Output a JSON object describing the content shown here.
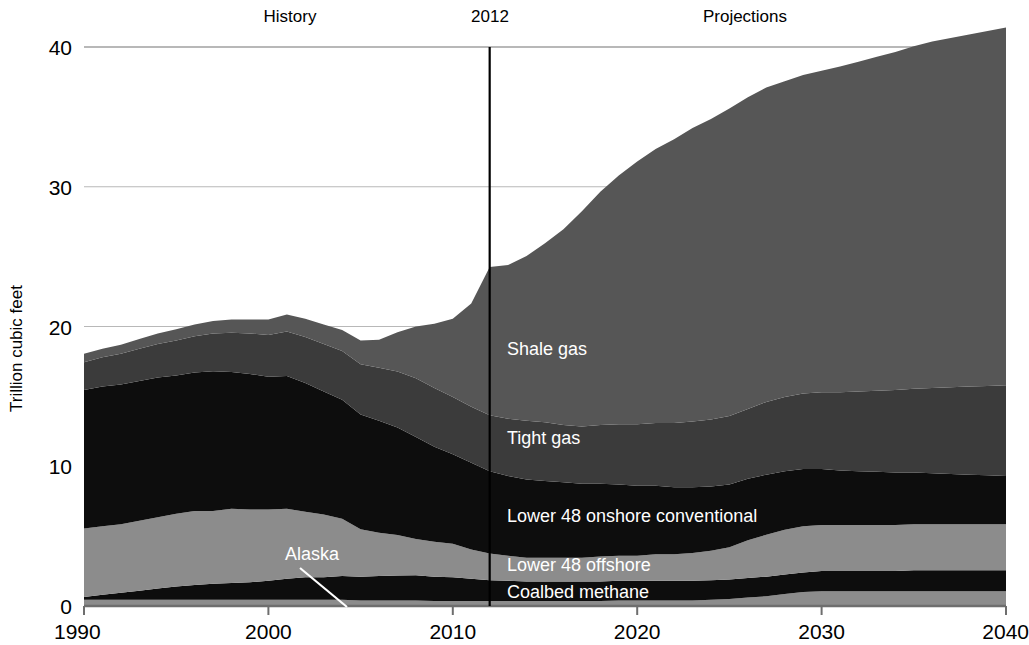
{
  "chart_data": {
    "type": "area",
    "stacked": true,
    "title": "",
    "xlabel": "",
    "ylabel": "Trillion cubic feet",
    "xlim": [
      1990,
      2040
    ],
    "ylim": [
      0,
      40
    ],
    "xticks": [
      "1990",
      "2000",
      "2010",
      "2020",
      "2030",
      "2040"
    ],
    "yticks": [
      "0",
      "10",
      "20",
      "30",
      "40"
    ],
    "grid": "horizontal",
    "legend_position": "inline-labels",
    "annotations": {
      "history": "History",
      "divider_year": "2012",
      "projections": "Projections"
    },
    "divider_x": 2012,
    "x": [
      1990,
      1991,
      1992,
      1993,
      1994,
      1995,
      1996,
      1997,
      1998,
      1999,
      2000,
      2001,
      2002,
      2003,
      2004,
      2005,
      2006,
      2007,
      2008,
      2009,
      2010,
      2011,
      2012,
      2013,
      2014,
      2015,
      2016,
      2017,
      2018,
      2019,
      2020,
      2021,
      2022,
      2023,
      2024,
      2025,
      2026,
      2027,
      2028,
      2029,
      2030,
      2031,
      2032,
      2033,
      2034,
      2035,
      2036,
      2037,
      2038,
      2039,
      2040
    ],
    "series": [
      {
        "name": "Alaska",
        "color": "#8c8c8c",
        "label_position": "callout",
        "values": [
          0.45,
          0.45,
          0.45,
          0.45,
          0.45,
          0.45,
          0.45,
          0.45,
          0.45,
          0.45,
          0.45,
          0.45,
          0.45,
          0.45,
          0.45,
          0.4,
          0.4,
          0.4,
          0.4,
          0.35,
          0.35,
          0.35,
          0.35,
          0.35,
          0.35,
          0.35,
          0.35,
          0.35,
          0.35,
          0.4,
          0.4,
          0.4,
          0.4,
          0.4,
          0.45,
          0.5,
          0.6,
          0.7,
          0.85,
          1.0,
          1.05,
          1.05,
          1.05,
          1.05,
          1.05,
          1.05,
          1.05,
          1.05,
          1.05,
          1.05,
          1.05
        ]
      },
      {
        "name": "Coalbed methane",
        "color": "#0d0d0d",
        "label_position": "inline",
        "values": [
          0.2,
          0.35,
          0.5,
          0.65,
          0.8,
          0.95,
          1.05,
          1.15,
          1.2,
          1.25,
          1.35,
          1.5,
          1.6,
          1.6,
          1.7,
          1.7,
          1.75,
          1.78,
          1.8,
          1.75,
          1.7,
          1.6,
          1.5,
          1.45,
          1.4,
          1.4,
          1.4,
          1.4,
          1.4,
          1.4,
          1.4,
          1.4,
          1.4,
          1.4,
          1.4,
          1.4,
          1.4,
          1.4,
          1.4,
          1.4,
          1.45,
          1.45,
          1.45,
          1.45,
          1.45,
          1.5,
          1.5,
          1.5,
          1.5,
          1.5,
          1.5
        ]
      },
      {
        "name": "Lower 48 offshore",
        "color": "#8c8c8c",
        "label_position": "inline",
        "values": [
          4.9,
          4.9,
          4.9,
          5.0,
          5.1,
          5.2,
          5.3,
          5.2,
          5.3,
          5.2,
          5.1,
          5.0,
          4.7,
          4.5,
          4.1,
          3.4,
          3.1,
          2.9,
          2.6,
          2.5,
          2.4,
          2.1,
          1.9,
          1.8,
          1.7,
          1.7,
          1.7,
          1.7,
          1.8,
          1.8,
          1.8,
          1.9,
          1.9,
          2.0,
          2.1,
          2.3,
          2.7,
          3.0,
          3.2,
          3.3,
          3.3,
          3.3,
          3.3,
          3.3,
          3.3,
          3.3,
          3.3,
          3.3,
          3.3,
          3.3,
          3.3
        ]
      },
      {
        "name": "Lower 48 onshore conventional",
        "color": "#0d0d0d",
        "label_position": "inline",
        "values": [
          9.9,
          10.0,
          10.0,
          10.0,
          10.0,
          9.9,
          9.9,
          10.0,
          9.8,
          9.7,
          9.5,
          9.5,
          9.2,
          8.8,
          8.5,
          8.2,
          8.0,
          7.7,
          7.3,
          6.8,
          6.4,
          6.2,
          5.9,
          5.7,
          5.6,
          5.5,
          5.4,
          5.3,
          5.2,
          5.1,
          5.0,
          4.9,
          4.8,
          4.7,
          4.6,
          4.5,
          4.4,
          4.3,
          4.2,
          4.1,
          4.0,
          3.9,
          3.85,
          3.8,
          3.75,
          3.7,
          3.65,
          3.6,
          3.55,
          3.5,
          3.45
        ]
      },
      {
        "name": "Tight gas",
        "color": "#3b3b3b",
        "label_position": "inline",
        "values": [
          2.0,
          2.1,
          2.2,
          2.3,
          2.4,
          2.5,
          2.6,
          2.7,
          2.8,
          2.9,
          3.0,
          3.2,
          3.3,
          3.4,
          3.5,
          3.6,
          3.8,
          4.0,
          4.2,
          4.2,
          4.1,
          4.0,
          4.0,
          4.1,
          4.2,
          4.2,
          4.1,
          4.1,
          4.2,
          4.3,
          4.4,
          4.5,
          4.6,
          4.7,
          4.8,
          4.9,
          5.0,
          5.2,
          5.3,
          5.4,
          5.5,
          5.6,
          5.7,
          5.8,
          5.9,
          6.0,
          6.1,
          6.2,
          6.3,
          6.4,
          6.5
        ]
      },
      {
        "name": "Shale gas",
        "color": "#565656",
        "label_position": "inline",
        "values": [
          0.6,
          0.6,
          0.65,
          0.7,
          0.75,
          0.8,
          0.85,
          0.9,
          0.95,
          1.0,
          1.1,
          1.2,
          1.3,
          1.4,
          1.5,
          1.7,
          2.0,
          2.8,
          3.7,
          4.6,
          5.6,
          7.4,
          10.6,
          11.0,
          11.8,
          12.8,
          14.0,
          15.4,
          16.7,
          17.8,
          18.8,
          19.6,
          20.3,
          21.0,
          21.5,
          22.0,
          22.3,
          22.5,
          22.6,
          22.8,
          23.0,
          23.3,
          23.6,
          23.9,
          24.2,
          24.5,
          24.8,
          25.0,
          25.2,
          25.4,
          25.6
        ]
      }
    ],
    "totals_note": [
      18.0,
      18.4,
      18.7,
      19.1,
      19.5,
      19.75,
      20.15,
      19.95,
      20.3,
      20.4,
      20.5,
      20.85,
      20.55,
      20.15,
      19.8,
      19.0,
      19.05,
      19.58,
      19.97,
      20.1,
      20.45,
      21.65,
      24.25,
      24.4,
      25.05,
      25.95,
      26.95,
      28.25,
      29.65,
      30.8,
      31.85,
      32.7,
      33.4,
      34.2,
      34.85,
      35.6,
      36.05,
      36.4,
      36.55,
      36.8,
      37.25,
      37.5,
      37.75,
      38.0,
      38.25,
      38.5,
      38.75,
      38.9,
      39.05,
      39.2,
      39.35
    ]
  },
  "axis": {
    "y_title": "Trillion cubic feet",
    "y_ticks": [
      {
        "value": 40,
        "label": "40"
      },
      {
        "value": 30,
        "label": "30"
      },
      {
        "value": 20,
        "label": "20"
      },
      {
        "value": 10,
        "label": "10"
      },
      {
        "value": 0,
        "label": "0"
      }
    ],
    "x_ticks": [
      {
        "value": 1990,
        "label": "1990"
      },
      {
        "value": 2000,
        "label": "2000"
      },
      {
        "value": 2010,
        "label": "2010"
      },
      {
        "value": 2020,
        "label": "2020"
      },
      {
        "value": 2030,
        "label": "2030"
      },
      {
        "value": 2040,
        "label": "2040"
      }
    ]
  },
  "top_labels": {
    "history": "History",
    "year_divider": "2012",
    "projections": "Projections"
  },
  "series_labels": {
    "shale_gas": "Shale gas",
    "tight_gas": "Tight gas",
    "lower48_onshore": "Lower 48 onshore conventional",
    "lower48_offshore": "Lower 48 offshore",
    "coalbed_methane": "Coalbed methane",
    "alaska": "Alaska"
  },
  "colors": {
    "shale_gas": "#565656",
    "tight_gas": "#3b3b3b",
    "lower48_onshore": "#0d0d0d",
    "lower48_offshore": "#8c8c8c",
    "coalbed_methane": "#0d0d0d",
    "alaska": "#8c8c8c",
    "gridline": "#b8b8b8",
    "axis": "#6e6e6e",
    "divider": "#000000",
    "label_text": "#ffffff",
    "tick_text": "#000000"
  }
}
